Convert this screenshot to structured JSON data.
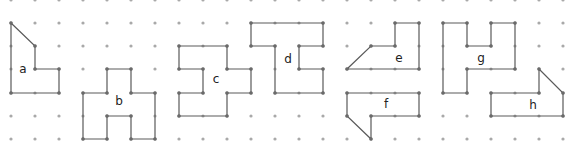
{
  "grid": {
    "columns": [
      11,
      35,
      59,
      83,
      107,
      131,
      155,
      179,
      203,
      227,
      251,
      275,
      299,
      323,
      347,
      371,
      395,
      419,
      443,
      467,
      491,
      515,
      539,
      563
    ],
    "rows": [
      0,
      23,
      46,
      69,
      93,
      116,
      139
    ],
    "dot_color": "#a9a9a9",
    "line_color": "#5a5a5a"
  },
  "shapes": [
    {
      "label": "a",
      "label_pos": [
        23,
        69
      ],
      "points": [
        [
          11,
          23
        ],
        [
          35,
          46
        ],
        [
          35,
          69
        ],
        [
          59,
          69
        ],
        [
          59,
          93
        ],
        [
          11,
          93
        ]
      ]
    },
    {
      "label": "b",
      "label_pos": [
        119,
        101
      ],
      "points": [
        [
          107,
          69
        ],
        [
          131,
          69
        ],
        [
          131,
          93
        ],
        [
          155,
          93
        ],
        [
          155,
          139
        ],
        [
          131,
          139
        ],
        [
          131,
          116
        ],
        [
          107,
          116
        ],
        [
          107,
          139
        ],
        [
          83,
          139
        ],
        [
          83,
          93
        ],
        [
          107,
          93
        ]
      ]
    },
    {
      "label": "c",
      "label_pos": [
        216,
        79
      ],
      "points": [
        [
          179,
          46
        ],
        [
          227,
          46
        ],
        [
          227,
          69
        ],
        [
          251,
          69
        ],
        [
          251,
          93
        ],
        [
          227,
          93
        ],
        [
          227,
          116
        ],
        [
          179,
          116
        ],
        [
          179,
          93
        ],
        [
          203,
          93
        ],
        [
          203,
          69
        ],
        [
          179,
          69
        ]
      ]
    },
    {
      "label": "d",
      "label_pos": [
        288,
        59
      ],
      "points": [
        [
          251,
          23
        ],
        [
          323,
          23
        ],
        [
          323,
          46
        ],
        [
          299,
          46
        ],
        [
          299,
          69
        ],
        [
          323,
          69
        ],
        [
          323,
          93
        ],
        [
          275,
          93
        ],
        [
          275,
          46
        ],
        [
          251,
          46
        ]
      ]
    },
    {
      "label": "e",
      "label_pos": [
        399,
        58
      ],
      "points": [
        [
          395,
          23
        ],
        [
          419,
          23
        ],
        [
          419,
          69
        ],
        [
          347,
          69
        ],
        [
          371,
          46
        ],
        [
          395,
          46
        ]
      ]
    },
    {
      "label": "f",
      "label_pos": [
        386,
        104
      ],
      "points": [
        [
          347,
          93
        ],
        [
          419,
          93
        ],
        [
          419,
          116
        ],
        [
          371,
          116
        ],
        [
          371,
          139
        ],
        [
          347,
          116
        ]
      ]
    },
    {
      "label": "g",
      "label_pos": [
        481,
        58
      ],
      "points": [
        [
          443,
          23
        ],
        [
          467,
          23
        ],
        [
          467,
          46
        ],
        [
          491,
          46
        ],
        [
          491,
          23
        ],
        [
          515,
          23
        ],
        [
          515,
          69
        ],
        [
          467,
          69
        ],
        [
          467,
          93
        ],
        [
          443,
          93
        ]
      ]
    },
    {
      "label": "h",
      "label_pos": [
        533,
        105
      ],
      "points": [
        [
          491,
          93
        ],
        [
          539,
          93
        ],
        [
          539,
          69
        ],
        [
          563,
          93
        ],
        [
          563,
          116
        ],
        [
          491,
          116
        ]
      ]
    }
  ]
}
